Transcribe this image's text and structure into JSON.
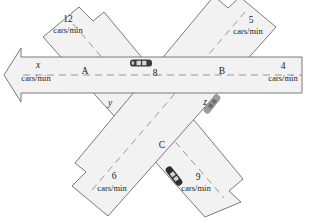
{
  "figure": {
    "type": "traffic-flow-network-diagram",
    "background_color": "#ffffff",
    "road_fill": "#f2f2f2",
    "road_stroke": "#6b6b6b",
    "dash_stroke": "#8c8c8c",
    "text_color": "#1a1a1a"
  },
  "nodes": [
    {
      "id": "A",
      "label": "A",
      "x": 85,
      "y": 74
    },
    {
      "id": "B",
      "label": "B",
      "x": 222,
      "y": 74
    },
    {
      "id": "C",
      "label": "C",
      "x": 162,
      "y": 148
    }
  ],
  "interior_flows": [
    {
      "id": "AB",
      "label": "8",
      "x": 155,
      "y": 76,
      "kind": "number"
    },
    {
      "id": "AC",
      "label": "y",
      "x": 110,
      "y": 106,
      "kind": "variable"
    },
    {
      "id": "BC",
      "label": "z",
      "x": 205,
      "y": 105,
      "kind": "variable"
    }
  ],
  "external_flows": [
    {
      "id": "in-top-left",
      "value": "12",
      "unit": "cars/min",
      "direction": "inbound",
      "corner": "top-left",
      "value_pos": {
        "x": 68,
        "y": 22
      },
      "unit_pos": {
        "x": 68,
        "y": 33
      }
    },
    {
      "id": "out-top-right",
      "value": "5",
      "unit": "cars/min",
      "direction": "outbound",
      "corner": "top-right",
      "value_pos": {
        "x": 251,
        "y": 23
      },
      "unit_pos": {
        "x": 248,
        "y": 34
      }
    },
    {
      "id": "out-left",
      "value": "x",
      "unit": "cars/min",
      "direction": "outbound",
      "corner": "left",
      "value_pos": {
        "x": 38,
        "y": 68
      },
      "unit_pos": {
        "x": 36,
        "y": 81
      }
    },
    {
      "id": "in-right",
      "value": "4",
      "unit": "cars/min",
      "direction": "inbound",
      "corner": "right",
      "value_pos": {
        "x": 283,
        "y": 69
      },
      "unit_pos": {
        "x": 283,
        "y": 81
      }
    },
    {
      "id": "in-bottom-left",
      "value": "6",
      "unit": "cars/min",
      "direction": "inbound",
      "corner": "bottom-left",
      "value_pos": {
        "x": 114,
        "y": 179
      },
      "unit_pos": {
        "x": 112,
        "y": 191
      }
    },
    {
      "id": "out-bottom-right",
      "value": "9",
      "unit": "cars/min",
      "direction": "outbound",
      "corner": "bottom-right",
      "value_pos": {
        "x": 198,
        "y": 180
      },
      "unit_pos": {
        "x": 196,
        "y": 191
      }
    }
  ],
  "cars": [
    {
      "id": "car-horizontal",
      "color": "#3a3a3a",
      "x": 141,
      "y": 63,
      "rotation": 0,
      "road": "horizontal"
    },
    {
      "id": "car-ne-sw",
      "color": "#9a9a9a",
      "x": 212,
      "y": 104,
      "rotation": -52,
      "road": "ne-sw"
    },
    {
      "id": "car-nw-se",
      "color": "#2e2e2e",
      "x": 174,
      "y": 176,
      "rotation": 52,
      "road": "nw-se"
    }
  ]
}
